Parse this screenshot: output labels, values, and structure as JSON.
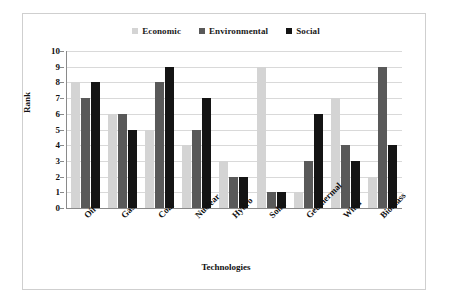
{
  "chart_data": {
    "type": "bar",
    "title": "",
    "xlabel": "Technologies",
    "ylabel": "Rank",
    "ylim": [
      0,
      10
    ],
    "ytick_step": 1,
    "yticks": [
      "10",
      "9",
      "8",
      "7",
      "6",
      "5",
      "4",
      "3",
      "2",
      "1",
      "0"
    ],
    "grid": true,
    "legend_position": "top-center",
    "categories": [
      "Oil",
      "Gas",
      "Coal",
      "Nuclear",
      "Hydro",
      "Solar",
      "Geothermal",
      "Wind",
      "Biomass"
    ],
    "series": [
      {
        "name": "Economic",
        "color": "#d4d4d4",
        "values": [
          8,
          6,
          5,
          4,
          3,
          9,
          1,
          7,
          2
        ]
      },
      {
        "name": "Environmental",
        "color": "#595959",
        "values": [
          7,
          6,
          8,
          5,
          2,
          1,
          3,
          4,
          9
        ]
      },
      {
        "name": "Social",
        "color": "#141414",
        "values": [
          8,
          5,
          9,
          7,
          2,
          1,
          6,
          3,
          4
        ]
      }
    ]
  },
  "figure": {
    "border_color": "#cfcfcf",
    "axis_color": "#8a8a8a",
    "gridline_color": "#d9d9d9",
    "background": "#ffffff"
  }
}
